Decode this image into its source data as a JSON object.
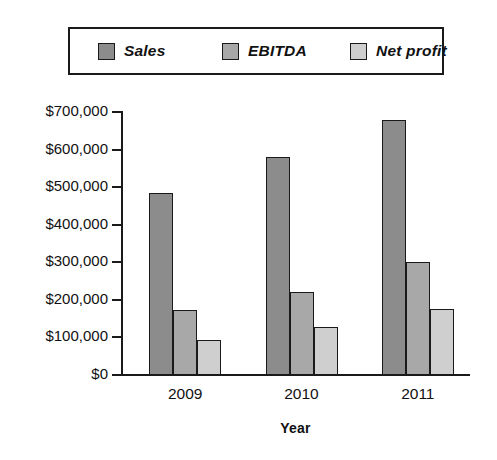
{
  "chart_data": {
    "type": "bar",
    "title": "",
    "subtitle": "",
    "xlabel": "Year",
    "ylabel": "",
    "categories": [
      "2009",
      "2010",
      "2011"
    ],
    "series": [
      {
        "name": "Sales",
        "values": [
          485000,
          580000,
          680000
        ],
        "color": "#8c8c8c"
      },
      {
        "name": "EBITDA",
        "values": [
          172000,
          220000,
          300000
        ],
        "color": "#a8a8a8"
      },
      {
        "name": "Net profit",
        "values": [
          92000,
          127000,
          177000
        ],
        "color": "#cfcfcf"
      }
    ],
    "ylim": [
      0,
      700000
    ],
    "ytick_values": [
      0,
      100000,
      200000,
      300000,
      400000,
      500000,
      600000,
      700000
    ],
    "ytick_labels": [
      "$0",
      "$100,000",
      "$200,000",
      "$300,000",
      "$400,000",
      "$500,000",
      "$600,000",
      "$700,000"
    ],
    "grid": false,
    "legend_position": "top",
    "legend_entries": [
      "Sales",
      "EBITDA",
      "Net profit"
    ],
    "axis_color": "#1a1a1a",
    "background_color": "#ffffff"
  }
}
